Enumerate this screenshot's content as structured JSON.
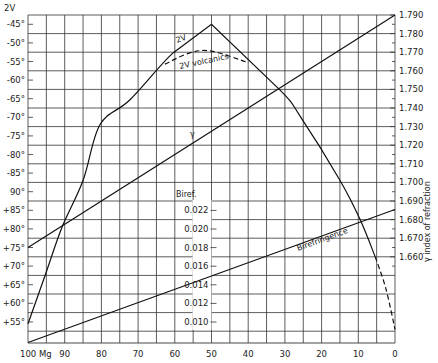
{
  "chart_data": {
    "type": "line",
    "title": "",
    "xlabel": "Mg",
    "x_ticks": [
      100,
      90,
      80,
      70,
      60,
      50,
      40,
      30,
      20,
      10,
      0
    ],
    "x_tick_labels": [
      "100 Mg",
      "90",
      "80",
      "70",
      "60",
      "50",
      "40",
      "30",
      "20",
      "10",
      "0"
    ],
    "xlim": [
      100,
      0
    ],
    "grid": true,
    "left_axis": {
      "label": "2V",
      "tick_labels": [
        "-45°",
        "-50°",
        "-55°",
        "-60°",
        "-65°",
        "-70°",
        "-75°",
        "-80°",
        "-85°",
        "90°",
        "+85°",
        "+80°",
        "+75°",
        "+70°",
        "+65°",
        "+60°",
        "+55°"
      ],
      "tick_values": [
        -45,
        -50,
        -55,
        -60,
        -65,
        -70,
        -75,
        -80,
        -85,
        90,
        85,
        80,
        75,
        70,
        65,
        60,
        55
      ]
    },
    "right_axis": {
      "label": "γ index of refraction",
      "tick_labels": [
        "1.790",
        "1.780",
        "1.770",
        "1.760",
        "1.750",
        "1.740",
        "1.730",
        "1.720",
        "1.710",
        "1.700",
        "1.690",
        "1.680",
        "1.670",
        "1.660"
      ],
      "ylim": [
        1.6535,
        1.79
      ]
    },
    "inner_axis": {
      "label": "Biref.",
      "tick_labels": [
        "0.022",
        "0.020",
        "0.018",
        "0.016",
        "0.014",
        "0.012",
        "0.010"
      ],
      "tick_values": [
        0.022,
        0.02,
        0.018,
        0.016,
        0.014,
        0.012,
        0.01
      ],
      "at_x": 50
    },
    "series": [
      {
        "name": "2V",
        "label": "2V",
        "axis": "left",
        "style": "solid",
        "points": [
          [
            100,
            54.5
          ],
          [
            95,
            68.5
          ],
          [
            90.7,
            80.5
          ],
          [
            85,
            -87
          ],
          [
            80.4,
            -72
          ],
          [
            72.2,
            -65.3
          ],
          [
            60.5,
            -52.7
          ],
          [
            50,
            -45
          ],
          [
            31.3,
            -62.7
          ],
          [
            25.9,
            -69.6
          ],
          [
            15,
            -86.9
          ],
          [
            9.5,
            82.5
          ],
          [
            5.4,
            72.5
          ]
        ]
      },
      {
        "name": "2V extrapolated",
        "label": "",
        "axis": "left",
        "style": "dashed",
        "points": [
          [
            5.4,
            72.5
          ],
          [
            2.5,
            64
          ],
          [
            0,
            53
          ]
        ]
      },
      {
        "name": "2V volcanics",
        "label": "2V volcanics",
        "axis": "left",
        "style": "dashed",
        "points": [
          [
            62.7,
            -55.7
          ],
          [
            55.9,
            -52.7
          ],
          [
            50,
            -52.2
          ],
          [
            40.6,
            -55.1
          ]
        ]
      },
      {
        "name": "γ",
        "label": "γ",
        "axis": "right",
        "style": "solid",
        "points": [
          [
            100,
            1.665
          ],
          [
            0,
            1.79
          ]
        ]
      },
      {
        "name": "Birefringence",
        "label": "Birefringence",
        "axis": "inner",
        "style": "solid",
        "points": [
          [
            100,
            0.0078
          ],
          [
            0,
            0.0221
          ]
        ]
      }
    ]
  }
}
